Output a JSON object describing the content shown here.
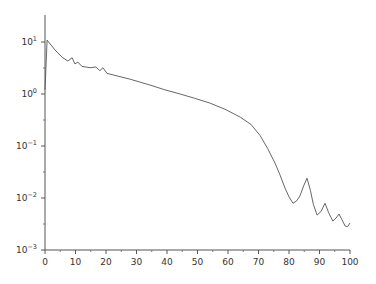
{
  "chart_data": {
    "type": "line",
    "title": "",
    "xlabel": "",
    "ylabel": "",
    "xscale": "linear",
    "yscale": "log",
    "xlim": [
      0,
      100
    ],
    "ylim": [
      0.001,
      30
    ],
    "grid": false,
    "legend": null,
    "x_ticks": [
      0,
      10,
      20,
      30,
      40,
      50,
      60,
      70,
      80,
      90,
      100
    ],
    "x_tick_labels": [
      "0",
      "10",
      "20",
      "30",
      "40",
      "50",
      "60",
      "70",
      "80",
      "90",
      "100"
    ],
    "y_ticks": [
      10,
      1,
      0.1,
      0.01,
      0.001
    ],
    "y_tick_labels": [
      {
        "base": "10",
        "exp": "1"
      },
      {
        "base": "10",
        "exp": "0"
      },
      {
        "base": "10",
        "exp": "−1"
      },
      {
        "base": "10",
        "exp": "−2"
      },
      {
        "base": "10",
        "exp": "−3"
      }
    ],
    "series": [
      {
        "name": "series-1",
        "color": "#555555",
        "x": [
          0,
          0.7,
          3.3,
          5.6,
          7.5,
          8.9,
          9.8,
          10.8,
          12.1,
          14.8,
          16.7,
          18.0,
          19.0,
          20.3,
          24.0,
          27.9,
          31.0,
          34.4,
          39.0,
          44.3,
          49.0,
          54.0,
          59.0,
          64.0,
          67.5,
          70.5,
          73.0,
          75.4,
          77.0,
          78.7,
          80.0,
          81.3,
          82.5,
          83.6,
          84.8,
          85.9,
          87.0,
          88.0,
          89.2,
          90.5,
          91.8,
          93.0,
          94.4,
          95.4,
          96.4,
          97.4,
          98.4,
          99.2,
          100
        ],
        "y": [
          1.2,
          10.9,
          7.0,
          5.1,
          4.3,
          5.0,
          3.8,
          4.1,
          3.4,
          3.2,
          3.3,
          2.8,
          3.2,
          2.5,
          2.2,
          1.93,
          1.7,
          1.49,
          1.22,
          1.0,
          0.83,
          0.67,
          0.51,
          0.36,
          0.26,
          0.16,
          0.09,
          0.047,
          0.028,
          0.0156,
          0.0105,
          0.0079,
          0.0088,
          0.011,
          0.017,
          0.024,
          0.014,
          0.0075,
          0.0047,
          0.0055,
          0.0079,
          0.0052,
          0.0036,
          0.0041,
          0.0049,
          0.0038,
          0.0029,
          0.0028,
          0.0033
        ]
      }
    ]
  }
}
